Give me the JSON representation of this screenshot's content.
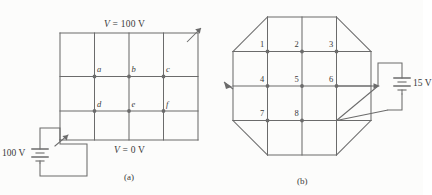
{
  "figure": {
    "background_color": "#fcfcfb",
    "line_color": "#6b6b6b",
    "text_color": "#3a3a3a"
  },
  "panel_a": {
    "caption": "(a)",
    "top_voltage_label": "V = 100 V",
    "bottom_voltage_label": "V = 0 V",
    "battery_label": "100 V",
    "node_labels": [
      "a",
      "b",
      "c",
      "d",
      "e",
      "f"
    ],
    "grid": {
      "columns": 4,
      "rows": 3
    }
  },
  "panel_b": {
    "caption": "(b)",
    "battery_label": "15 V",
    "node_labels": [
      "1",
      "2",
      "3",
      "4",
      "5",
      "6",
      "7",
      "8"
    ],
    "grid": {
      "columns": 4,
      "rows": 4,
      "shape": "octagon"
    }
  }
}
